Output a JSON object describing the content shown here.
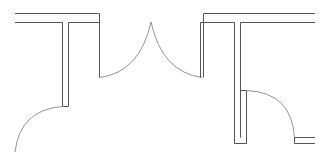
{
  "diagram": {
    "type": "architectural-floor-plan",
    "elements": [
      "walls",
      "double-door",
      "single-door-left",
      "single-door-right"
    ],
    "colors": {
      "background": "#ffffff",
      "wall_stroke": "#555555",
      "swing_stroke": "#777777"
    }
  }
}
